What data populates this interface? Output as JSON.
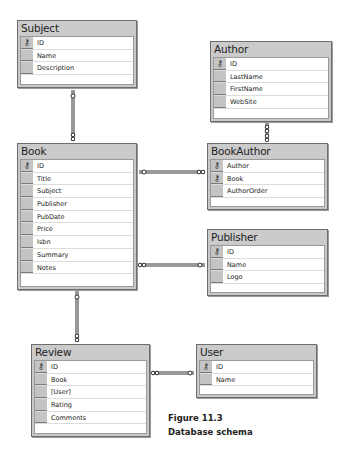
{
  "tables": {
    "subject": {
      "title": "Subject",
      "columns": [
        {
          "name": "ID",
          "pk": true
        },
        {
          "name": "Name",
          "pk": false
        },
        {
          "name": "Description",
          "pk": false
        }
      ]
    },
    "author": {
      "title": "Author",
      "columns": [
        {
          "name": "ID",
          "pk": true
        },
        {
          "name": "LastName",
          "pk": false
        },
        {
          "name": "FirstName",
          "pk": false
        },
        {
          "name": "WebSite",
          "pk": false
        }
      ]
    },
    "book": {
      "title": "Book",
      "columns": [
        {
          "name": "ID",
          "pk": true
        },
        {
          "name": "Title",
          "pk": false
        },
        {
          "name": "Subject",
          "pk": false
        },
        {
          "name": "Publisher",
          "pk": false
        },
        {
          "name": "PubDate",
          "pk": false
        },
        {
          "name": "Price",
          "pk": false
        },
        {
          "name": "Isbn",
          "pk": false
        },
        {
          "name": "Summary",
          "pk": false
        },
        {
          "name": "Notes",
          "pk": false
        }
      ]
    },
    "bookauthor": {
      "title": "BookAuthor",
      "columns": [
        {
          "name": "Author",
          "pk": true
        },
        {
          "name": "Book",
          "pk": true
        },
        {
          "name": "AuthorOrder",
          "pk": false
        }
      ]
    },
    "publisher": {
      "title": "Publisher",
      "columns": [
        {
          "name": "ID",
          "pk": true
        },
        {
          "name": "Name",
          "pk": false
        },
        {
          "name": "Logo",
          "pk": false
        }
      ]
    },
    "review": {
      "title": "Review",
      "columns": [
        {
          "name": "ID",
          "pk": true
        },
        {
          "name": "Book",
          "pk": false
        },
        {
          "name": "[User]",
          "pk": false
        },
        {
          "name": "Rating",
          "pk": false
        },
        {
          "name": "Comments",
          "pk": false
        }
      ]
    },
    "user": {
      "title": "User",
      "columns": [
        {
          "name": "ID",
          "pk": true
        },
        {
          "name": "Name",
          "pk": false
        }
      ]
    }
  },
  "relationships": [
    {
      "from": "Subject",
      "to": "Book",
      "type": "one-to-many"
    },
    {
      "from": "Author",
      "to": "BookAuthor",
      "type": "one-to-many"
    },
    {
      "from": "Book",
      "to": "BookAuthor",
      "type": "one-to-many"
    },
    {
      "from": "Publisher",
      "to": "Book",
      "type": "one-to-many"
    },
    {
      "from": "Book",
      "to": "Review",
      "type": "one-to-many"
    },
    {
      "from": "User",
      "to": "Review",
      "type": "one-to-many"
    }
  ],
  "icons": {
    "key": "⚷"
  },
  "caption": {
    "line1": "Figure 11.3",
    "line2": "Database schema"
  }
}
